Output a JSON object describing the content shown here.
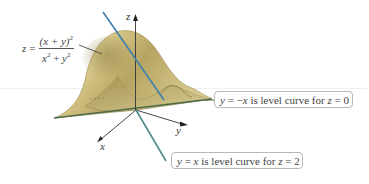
{
  "figure": {
    "formula": {
      "lhs": "z",
      "eq": "=",
      "numerator": "(x + y)",
      "numerator_exp": "2",
      "denominator_a": "x",
      "denominator_a_exp": "2",
      "denominator_plus": " + ",
      "denominator_b": "y",
      "denominator_b_exp": "2"
    },
    "axes": {
      "z_label": "z",
      "x_label": "x",
      "y_label": "y"
    },
    "callouts": [
      {
        "prefix": "y",
        "relation": " = −",
        "var": "x",
        "text": " is level curve for ",
        "zvar": "z",
        "value": " = 0"
      },
      {
        "prefix": "y",
        "relation": " = ",
        "var": "x",
        "text": " is level curve for ",
        "zvar": "z",
        "value": " = 2"
      }
    ],
    "colors": {
      "surface_light": "#e8dca8",
      "surface_mid": "#c9b774",
      "surface_dark": "#8f7f45",
      "level_curve_z0": "#3f7fae",
      "level_curve_z2": "#4a8a88",
      "base_line": "#4d6b4a",
      "axis": "#333333"
    }
  }
}
